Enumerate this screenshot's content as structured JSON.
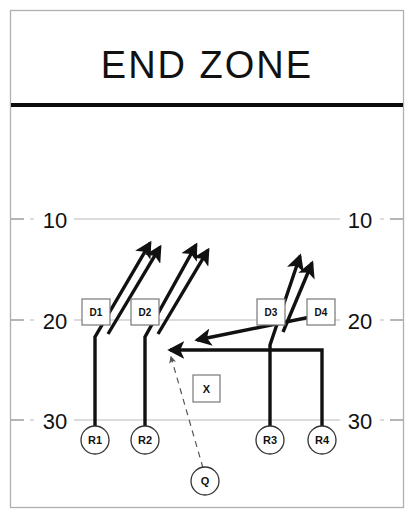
{
  "diagram": {
    "title": "END ZONE",
    "type": "american-football-play-diagram"
  },
  "yard_lines": [
    {
      "label": "10",
      "y": 219
    },
    {
      "label": "20",
      "y": 320
    },
    {
      "label": "30",
      "y": 420
    }
  ],
  "receivers": [
    {
      "id": "R1",
      "label": "R1",
      "x": 95,
      "y": 440
    },
    {
      "id": "R2",
      "label": "R2",
      "x": 145,
      "y": 440
    },
    {
      "id": "R3",
      "label": "R3",
      "x": 270,
      "y": 440
    },
    {
      "id": "R4",
      "label": "R4",
      "x": 322,
      "y": 440
    }
  ],
  "quarterback": {
    "id": "Q",
    "label": "Q",
    "x": 205,
    "y": 481
  },
  "defenders": [
    {
      "id": "D1",
      "label": "D1",
      "x": 97,
      "y": 313
    },
    {
      "id": "D2",
      "label": "D2",
      "x": 146,
      "y": 313
    },
    {
      "id": "D3",
      "label": "D3",
      "x": 272,
      "y": 313
    },
    {
      "id": "D4",
      "label": "D4",
      "x": 322,
      "y": 313
    }
  ],
  "marker": {
    "id": "X",
    "label": "X",
    "x": 206,
    "y": 389
  },
  "colors": {
    "line": "#111111",
    "yardline": "#b9b9b9",
    "goal_line": "#0b0b0b",
    "frame": "#b0b0b0",
    "pass": "#555555",
    "background": "#ffffff"
  }
}
